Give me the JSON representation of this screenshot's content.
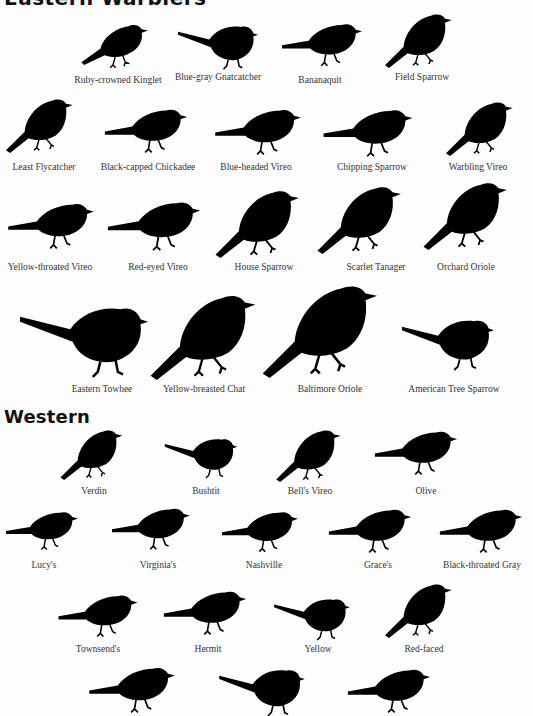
{
  "page": {
    "top_heading_partial": "Eastern Warblers",
    "western_heading": "Western"
  },
  "eastern": {
    "rows": [
      {
        "birds": [
          {
            "name": "Ruby-crowned Kinglet"
          },
          {
            "name": "Blue-gray Gnatcatcher"
          },
          {
            "name": "Bananaquit"
          },
          {
            "name": "Field Sparrow"
          }
        ]
      },
      {
        "birds": [
          {
            "name": "Least Flycatcher"
          },
          {
            "name": "Black-capped Chickadee"
          },
          {
            "name": "Blue-headed Vireo"
          },
          {
            "name": "Chipping Sparrow"
          },
          {
            "name": "Warbling Vireo"
          }
        ]
      },
      {
        "birds": [
          {
            "name": "Yellow-throated Vireo"
          },
          {
            "name": "Red-eyed Vireo"
          },
          {
            "name": "House Sparrow"
          },
          {
            "name": "Scarlet Tanager"
          },
          {
            "name": "Orchard Oriole"
          }
        ]
      },
      {
        "birds": [
          {
            "name": "Eastern Towhee"
          },
          {
            "name": "Yellow-breasted Chat"
          },
          {
            "name": "Baltimore Oriole"
          },
          {
            "name": "American Tree Sparrow"
          }
        ]
      }
    ]
  },
  "western": {
    "rows": [
      {
        "birds": [
          {
            "name": "Verdin"
          },
          {
            "name": "Bushtit"
          },
          {
            "name": "Bell's Vireo"
          },
          {
            "name": "Olive"
          }
        ]
      },
      {
        "birds": [
          {
            "name": "Lucy's"
          },
          {
            "name": "Virginia's"
          },
          {
            "name": "Nashville"
          },
          {
            "name": "Grace's"
          },
          {
            "name": "Black-throated Gray"
          }
        ]
      },
      {
        "birds": [
          {
            "name": "Townsend's"
          },
          {
            "name": "Hermit"
          },
          {
            "name": "Yellow"
          },
          {
            "name": "Red-faced"
          }
        ]
      },
      {
        "birds": [
          {
            "name": ""
          },
          {
            "name": ""
          },
          {
            "name": ""
          }
        ]
      }
    ]
  },
  "colors": {
    "background": "#fdfdfd",
    "silhouette": "#000000",
    "label_text": "#333333"
  }
}
